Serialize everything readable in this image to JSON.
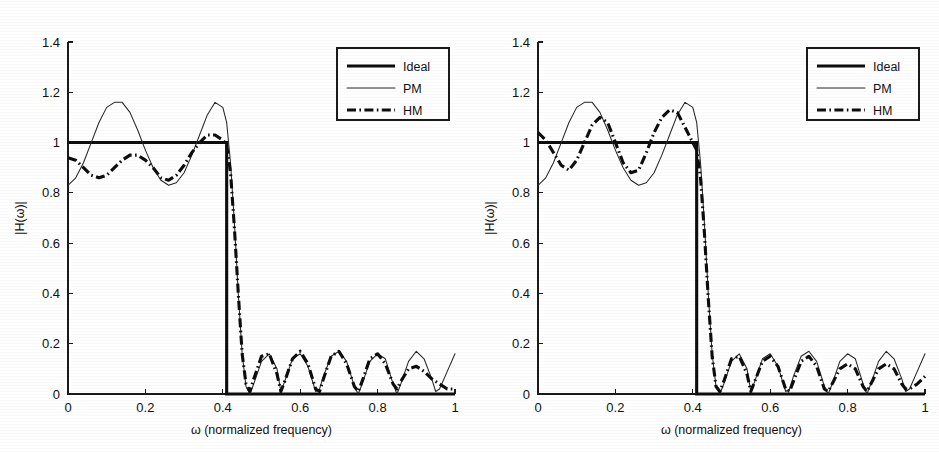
{
  "figure": {
    "background_color": "#ffffff",
    "ink_color": "#111111",
    "panel_count": 2
  },
  "chart_data": [
    {
      "type": "line",
      "panel_id": "left",
      "title": "",
      "xlabel": "ω (normalized frequency)",
      "ylabel": "|H(ω)|",
      "xlim": [
        0,
        1
      ],
      "ylim": [
        0,
        1.4
      ],
      "xticks": [
        0,
        0.2,
        0.4,
        0.6,
        0.8,
        1
      ],
      "xticklabels": [
        "0",
        "0.2",
        "0.4",
        "0.6",
        "0.8",
        "1"
      ],
      "yticks": [
        0,
        0.2,
        0.4,
        0.6,
        0.8,
        1,
        1.2,
        1.4
      ],
      "yticklabels": [
        "0",
        "0.2",
        "0.4",
        "0.6",
        "0.8",
        "1",
        "1.2",
        "1.4"
      ],
      "grid": false,
      "legend_position": "upper right",
      "legend_entries": [
        "Ideal",
        "PM",
        "HM"
      ],
      "cutoff_frequency": 0.41,
      "series": [
        {
          "name": "Ideal",
          "style": "thick-solid",
          "color": "#0d0d0d",
          "x": [
            0,
            0.41,
            0.41,
            1
          ],
          "values": [
            1,
            1,
            0,
            0
          ]
        },
        {
          "name": "PM",
          "style": "thin-solid",
          "color": "#262626",
          "x": [
            0,
            0.02,
            0.04,
            0.06,
            0.08,
            0.1,
            0.12,
            0.14,
            0.16,
            0.18,
            0.2,
            0.22,
            0.24,
            0.26,
            0.28,
            0.3,
            0.32,
            0.34,
            0.36,
            0.38,
            0.4,
            0.41,
            0.42,
            0.43,
            0.44,
            0.45,
            0.46,
            0.47,
            0.48,
            0.5,
            0.52,
            0.54,
            0.55,
            0.56,
            0.58,
            0.6,
            0.62,
            0.64,
            0.65,
            0.66,
            0.68,
            0.7,
            0.72,
            0.74,
            0.75,
            0.76,
            0.78,
            0.8,
            0.82,
            0.84,
            0.85,
            0.86,
            0.88,
            0.9,
            0.92,
            0.94,
            0.95,
            0.96,
            0.98,
            1.0
          ],
          "values": [
            0.83,
            0.86,
            0.92,
            1.0,
            1.08,
            1.14,
            1.16,
            1.16,
            1.12,
            1.05,
            0.97,
            0.9,
            0.85,
            0.83,
            0.84,
            0.88,
            0.95,
            1.03,
            1.11,
            1.16,
            1.14,
            1.08,
            0.92,
            0.68,
            0.4,
            0.16,
            0.03,
            0.0,
            0.04,
            0.13,
            0.16,
            0.1,
            0.01,
            0.05,
            0.14,
            0.16,
            0.11,
            0.01,
            0.02,
            0.07,
            0.15,
            0.17,
            0.13,
            0.03,
            0.0,
            0.04,
            0.13,
            0.16,
            0.14,
            0.04,
            0.0,
            0.04,
            0.13,
            0.17,
            0.14,
            0.06,
            0.01,
            0.02,
            0.09,
            0.16
          ]
        },
        {
          "name": "HM",
          "style": "thick-dashdot",
          "color": "#0d0d0d",
          "x": [
            0,
            0.02,
            0.04,
            0.06,
            0.08,
            0.1,
            0.12,
            0.14,
            0.16,
            0.18,
            0.2,
            0.22,
            0.24,
            0.26,
            0.28,
            0.3,
            0.32,
            0.34,
            0.36,
            0.38,
            0.4,
            0.41,
            0.42,
            0.43,
            0.44,
            0.45,
            0.46,
            0.47,
            0.48,
            0.5,
            0.52,
            0.54,
            0.55,
            0.56,
            0.58,
            0.6,
            0.62,
            0.64,
            0.65,
            0.66,
            0.68,
            0.7,
            0.72,
            0.74,
            0.75,
            0.76,
            0.78,
            0.8,
            0.82,
            0.84,
            0.85,
            0.86,
            0.88,
            0.9,
            0.92,
            0.94,
            0.95,
            0.96,
            0.98,
            1.0
          ],
          "values": [
            0.94,
            0.93,
            0.9,
            0.87,
            0.86,
            0.87,
            0.9,
            0.93,
            0.95,
            0.95,
            0.93,
            0.9,
            0.86,
            0.85,
            0.87,
            0.91,
            0.96,
            1.0,
            1.03,
            1.03,
            1.01,
            0.99,
            0.88,
            0.66,
            0.4,
            0.16,
            0.04,
            0.01,
            0.06,
            0.15,
            0.16,
            0.08,
            0.01,
            0.05,
            0.14,
            0.17,
            0.12,
            0.02,
            0.01,
            0.06,
            0.15,
            0.17,
            0.12,
            0.03,
            0.01,
            0.05,
            0.14,
            0.16,
            0.12,
            0.04,
            0.02,
            0.05,
            0.1,
            0.11,
            0.09,
            0.06,
            0.05,
            0.04,
            0.02,
            0.02
          ]
        }
      ]
    },
    {
      "type": "line",
      "panel_id": "right",
      "title": "",
      "xlabel": "ω (normalized frequency)",
      "ylabel": "|H(ω)|",
      "xlim": [
        0,
        1
      ],
      "ylim": [
        0,
        1.4
      ],
      "xticks": [
        0,
        0.2,
        0.4,
        0.6,
        0.8,
        1
      ],
      "xticklabels": [
        "0",
        "0.2",
        "0.4",
        "0.6",
        "0.8",
        "1"
      ],
      "yticks": [
        0,
        0.2,
        0.4,
        0.6,
        0.8,
        1,
        1.2,
        1.4
      ],
      "yticklabels": [
        "0",
        "0.2",
        "0.4",
        "0.6",
        "0.8",
        "1",
        "1.2",
        "1.4"
      ],
      "grid": false,
      "legend_position": "upper right",
      "legend_entries": [
        "Ideal",
        "PM",
        "HM"
      ],
      "cutoff_frequency": 0.41,
      "series": [
        {
          "name": "Ideal",
          "style": "thick-solid",
          "color": "#0d0d0d",
          "x": [
            0,
            0.41,
            0.41,
            1
          ],
          "values": [
            1,
            1,
            0,
            0
          ]
        },
        {
          "name": "PM",
          "style": "thin-solid",
          "color": "#262626",
          "x": [
            0,
            0.02,
            0.04,
            0.06,
            0.08,
            0.1,
            0.12,
            0.14,
            0.16,
            0.18,
            0.2,
            0.22,
            0.24,
            0.26,
            0.28,
            0.3,
            0.32,
            0.34,
            0.36,
            0.38,
            0.4,
            0.41,
            0.42,
            0.43,
            0.44,
            0.45,
            0.46,
            0.47,
            0.48,
            0.5,
            0.52,
            0.54,
            0.55,
            0.56,
            0.58,
            0.6,
            0.62,
            0.64,
            0.65,
            0.66,
            0.68,
            0.7,
            0.72,
            0.74,
            0.75,
            0.76,
            0.78,
            0.8,
            0.82,
            0.84,
            0.85,
            0.86,
            0.88,
            0.9,
            0.92,
            0.94,
            0.95,
            0.96,
            0.98,
            1.0
          ],
          "values": [
            0.83,
            0.86,
            0.92,
            1.0,
            1.08,
            1.14,
            1.16,
            1.16,
            1.12,
            1.05,
            0.97,
            0.9,
            0.85,
            0.83,
            0.84,
            0.88,
            0.95,
            1.03,
            1.11,
            1.16,
            1.14,
            1.08,
            0.92,
            0.68,
            0.4,
            0.16,
            0.03,
            0.0,
            0.04,
            0.13,
            0.16,
            0.1,
            0.01,
            0.05,
            0.14,
            0.16,
            0.11,
            0.01,
            0.02,
            0.07,
            0.15,
            0.17,
            0.13,
            0.03,
            0.0,
            0.04,
            0.13,
            0.16,
            0.14,
            0.04,
            0.0,
            0.04,
            0.13,
            0.17,
            0.14,
            0.06,
            0.01,
            0.02,
            0.09,
            0.16
          ]
        },
        {
          "name": "HM",
          "style": "thick-dashdot",
          "color": "#0d0d0d",
          "x": [
            0,
            0.02,
            0.04,
            0.06,
            0.08,
            0.1,
            0.12,
            0.14,
            0.16,
            0.18,
            0.2,
            0.22,
            0.24,
            0.26,
            0.28,
            0.3,
            0.32,
            0.34,
            0.36,
            0.38,
            0.4,
            0.41,
            0.42,
            0.43,
            0.44,
            0.45,
            0.46,
            0.47,
            0.48,
            0.5,
            0.52,
            0.54,
            0.55,
            0.56,
            0.58,
            0.6,
            0.62,
            0.64,
            0.65,
            0.66,
            0.68,
            0.7,
            0.72,
            0.74,
            0.75,
            0.76,
            0.78,
            0.8,
            0.82,
            0.84,
            0.85,
            0.86,
            0.88,
            0.9,
            0.92,
            0.94,
            0.95,
            0.96,
            0.98,
            1.0
          ],
          "values": [
            1.04,
            1.01,
            0.96,
            0.91,
            0.89,
            0.93,
            1.0,
            1.07,
            1.1,
            1.08,
            1.0,
            0.92,
            0.88,
            0.89,
            0.96,
            1.04,
            1.1,
            1.13,
            1.12,
            1.06,
            1.0,
            0.97,
            0.86,
            0.64,
            0.38,
            0.15,
            0.03,
            0.01,
            0.05,
            0.14,
            0.15,
            0.08,
            0.01,
            0.05,
            0.13,
            0.15,
            0.11,
            0.02,
            0.01,
            0.05,
            0.13,
            0.15,
            0.11,
            0.02,
            0.01,
            0.04,
            0.1,
            0.12,
            0.1,
            0.03,
            0.01,
            0.04,
            0.1,
            0.12,
            0.1,
            0.04,
            0.02,
            0.02,
            0.04,
            0.07
          ]
        }
      ]
    }
  ]
}
